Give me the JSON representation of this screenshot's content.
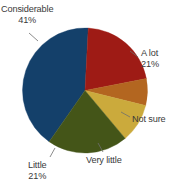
{
  "chart_data": {
    "type": "pie",
    "title": "",
    "subtitle": "",
    "xlabel": "",
    "ylabel": "",
    "grid": false,
    "legend_position": "none",
    "labels_position": "outside-with-leader-lines",
    "categories": [
      "Considerable",
      "A lot",
      "Not sure",
      "Very little",
      "Little"
    ],
    "values": [
      41,
      21,
      7,
      10,
      21
    ],
    "slices": [
      {
        "name": "Considerable",
        "label": "Considerable",
        "value_label": "41%",
        "value": 41,
        "color": "#14406a",
        "start_angle_deg": 215,
        "end_angle_deg": 363
      },
      {
        "name": "A lot",
        "label": "A lot",
        "value_label": "21%",
        "value": 21,
        "color": "#9e1b15",
        "start_angle_deg": 3,
        "end_angle_deg": 79
      },
      {
        "name": "Not sure",
        "label": "Not sure",
        "value_label": "",
        "value": 7,
        "color": "#b36620",
        "start_angle_deg": 79,
        "end_angle_deg": 104
      },
      {
        "name": "Very little",
        "label": "Very little",
        "value_label": "",
        "value": 10,
        "color": "#cbaa3c",
        "start_angle_deg": 104,
        "end_angle_deg": 140
      },
      {
        "name": "Little",
        "label": "Little",
        "value_label": "21%",
        "value": 21,
        "color": "#445518",
        "start_angle_deg": 140,
        "end_angle_deg": 215
      }
    ]
  },
  "colors": {
    "considerable": "#14406a",
    "a_lot": "#9e1b15",
    "not_sure": "#b36620",
    "very_little": "#cbaa3c",
    "little": "#445518",
    "background": "#ffffff",
    "label_text": "#3a3a3a",
    "leader_line": "#6e6e6e"
  },
  "labels": {
    "considerable": {
      "text": "Considerable",
      "percent": "41%"
    },
    "a_lot": {
      "text": "A lot",
      "percent": "21%"
    },
    "not_sure": {
      "text": "Not sure",
      "percent": ""
    },
    "very_little": {
      "text": "Very little",
      "percent": ""
    },
    "little": {
      "text": "Little",
      "percent": "21%"
    }
  }
}
